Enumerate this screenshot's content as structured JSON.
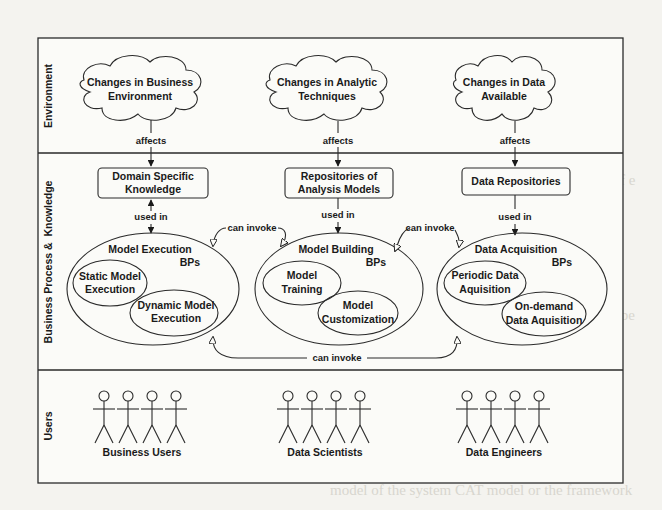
{
  "lanes": [
    {
      "id": "environment",
      "label": "Environment"
    },
    {
      "id": "bpk",
      "label": "Business Process &  Knowledge"
    },
    {
      "id": "users",
      "label": "Users"
    }
  ],
  "clouds": [
    {
      "line1": "Changes in Business",
      "line2": "Environment"
    },
    {
      "line1": "Changes in Analytic",
      "line2": "Techniques"
    },
    {
      "line1": "Changes in Data",
      "line2": "Available"
    }
  ],
  "edges": {
    "affects": "affects",
    "used_in": "used in",
    "can_invoke": "can invoke"
  },
  "knowledge_boxes": [
    {
      "line1": "Domain Specific",
      "line2": "Knowledge"
    },
    {
      "line1": "Repositories of",
      "line2": "Analysis Models"
    },
    {
      "line1": "Data Repositories",
      "line2": ""
    }
  ],
  "process_groups": [
    {
      "title": "Model Execution",
      "suffix": "BPs",
      "subprocesses": [
        {
          "line1": "Static Model",
          "line2": "Execution"
        },
        {
          "line1": "Dynamic Model",
          "line2": "Execution"
        }
      ]
    },
    {
      "title": "Model Building",
      "suffix": "BPs",
      "subprocesses": [
        {
          "line1": "Model",
          "line2": "Training"
        },
        {
          "line1": "Model",
          "line2": "Customization"
        }
      ]
    },
    {
      "title": "Data Acquisition",
      "suffix": "BPs",
      "subprocesses": [
        {
          "line1": "Periodic Data",
          "line2": "Aquisition"
        },
        {
          "line1": "On-demand",
          "line2": "Data Aquisition"
        }
      ]
    }
  ],
  "user_groups": [
    {
      "label": "Business Users"
    },
    {
      "label": "Data Scientists"
    },
    {
      "label": "Data Engineers"
    }
  ],
  "colors": {
    "page": "#f4f3ef",
    "ink": "#1a1a1a",
    "show_through": "#d6d3cc"
  }
}
